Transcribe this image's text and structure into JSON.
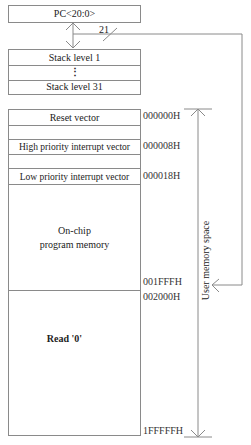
{
  "pc": {
    "label": "PC<20:0>",
    "bus_width": "21"
  },
  "stack": {
    "top": "Stack level 1",
    "ellipsis": "⋮",
    "bottom": "Stack level 31"
  },
  "memory": {
    "reset": "Reset vector",
    "high_int": "High priority interrupt vector",
    "low_int": "Low priority interrupt vector",
    "program_line1": "On-chip",
    "program_line2": "program memory",
    "read_zero": "Read '0'"
  },
  "addresses": {
    "a0": "000000H",
    "a8": "000008H",
    "a18": "000018H",
    "end_prog": "001FFFH",
    "start_unimpl": "002000H",
    "end": "1FFFFFH"
  },
  "side_label": "User memory space",
  "colors": {
    "line": "#8a8a8a",
    "text": "#222222"
  }
}
